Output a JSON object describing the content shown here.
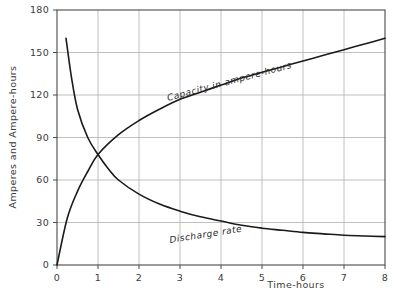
{
  "chart_data": {
    "type": "line",
    "title": "",
    "xlabel": "Time-hours",
    "ylabel": "Amperes and Ampere-hours",
    "xlim": [
      0,
      8
    ],
    "ylim": [
      0,
      180
    ],
    "xticks": [
      "0",
      "1",
      "2",
      "3",
      "4",
      "5",
      "6",
      "7",
      "8"
    ],
    "yticks": [
      "0",
      "30",
      "60",
      "90",
      "120",
      "150",
      "180"
    ],
    "grid": true,
    "legend_position": "inline-curve-labels",
    "series": [
      {
        "name": "Capacity in ampere-hours",
        "label": "Capacity in ampere-hours",
        "x": [
          0,
          0.25,
          0.5,
          0.75,
          1,
          1.5,
          2,
          2.5,
          3,
          3.5,
          4,
          4.5,
          5,
          5.5,
          6,
          6.5,
          7,
          7.5,
          8
        ],
        "values": [
          0,
          33,
          52,
          66,
          78,
          92,
          102,
          110,
          117,
          122,
          127,
          132,
          136,
          140,
          144,
          148,
          152,
          156,
          160
        ]
      },
      {
        "name": "Discharge rate",
        "label": "Discharge rate",
        "x": [
          0.22,
          0.35,
          0.5,
          0.75,
          1,
          1.25,
          1.5,
          2,
          2.5,
          3,
          3.5,
          4,
          4.5,
          5,
          5.5,
          6,
          6.5,
          7,
          7.5,
          8
        ],
        "values": [
          160,
          133,
          110,
          90,
          78,
          68,
          60,
          50,
          43,
          38,
          34,
          31,
          28,
          26,
          24.5,
          23,
          22,
          21,
          20.5,
          20
        ]
      }
    ]
  },
  "axes": {
    "y_title": "Amperes and Ampere-hours",
    "x_title": "Time-hours"
  }
}
